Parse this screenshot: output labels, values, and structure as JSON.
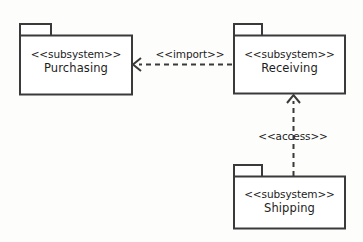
{
  "diagram": {
    "type": "uml-package-diagram",
    "canvas": {
      "width": 363,
      "height": 242,
      "background": "#fdfdfc"
    },
    "style": {
      "stroke_color": "#3a3a3a",
      "fill_color": "#ffffff",
      "text_color": "#1d1d1d",
      "stroke_width": 2,
      "dash_pattern": "5 4"
    },
    "packages": [
      {
        "id": "purchasing",
        "stereotype": "<<subsystem>>",
        "name": "Purchasing",
        "tab": {
          "x": 19,
          "y": 23,
          "width": 33,
          "height": 12
        },
        "body": {
          "x": 19,
          "y": 35,
          "width": 113,
          "height": 60
        }
      },
      {
        "id": "receiving",
        "stereotype": "<<subsystem>>",
        "name": "Receiving",
        "tab": {
          "x": 233,
          "y": 23,
          "width": 30,
          "height": 12
        },
        "body": {
          "x": 233,
          "y": 35,
          "width": 112,
          "height": 59
        }
      },
      {
        "id": "shipping",
        "stereotype": "<<subsystem>>",
        "name": "Shipping",
        "tab": {
          "x": 233,
          "y": 164,
          "width": 30,
          "height": 12
        },
        "body": {
          "x": 233,
          "y": 176,
          "width": 112,
          "height": 53
        }
      }
    ],
    "dependencies": [
      {
        "id": "import-dependency",
        "label": "<<import>>",
        "from": "receiving",
        "to": "purchasing",
        "arrow": "open",
        "line": "dashed",
        "path": {
          "x1": 233,
          "y1": 64,
          "x2": 134,
          "y2": 64
        },
        "label_pos": {
          "x": 190,
          "y": 55
        }
      },
      {
        "id": "access-dependency",
        "label": "<<access>>",
        "from": "shipping",
        "to": "receiving",
        "arrow": "open",
        "line": "dashed",
        "path": {
          "x1": 294,
          "y1": 176,
          "x2": 294,
          "y2": 95
        },
        "label_pos": {
          "x": 293,
          "y": 137
        }
      }
    ]
  }
}
